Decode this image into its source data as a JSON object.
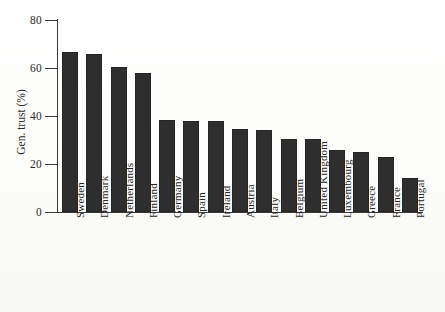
{
  "chart_data": {
    "type": "bar",
    "title": "",
    "xlabel": "",
    "ylabel": "Gen. trust (%)",
    "ylim": [
      0,
      80
    ],
    "yticks": [
      0,
      20,
      40,
      60,
      80
    ],
    "grid": false,
    "legend": "none",
    "bar_color": "#2e2e2e",
    "categories": [
      "Sweden",
      "Denmark",
      "Netherlands",
      "Finland",
      "Germany",
      "Spain",
      "Ireland",
      "Austria",
      "Italy",
      "Belgium",
      "United Kingdom",
      "Luxembourg",
      "Greece",
      "France",
      "Portugal"
    ],
    "values": [
      66.5,
      66,
      60.5,
      58,
      38.5,
      38,
      38,
      34.5,
      34,
      30.5,
      30.5,
      26,
      25,
      23,
      14
    ]
  }
}
